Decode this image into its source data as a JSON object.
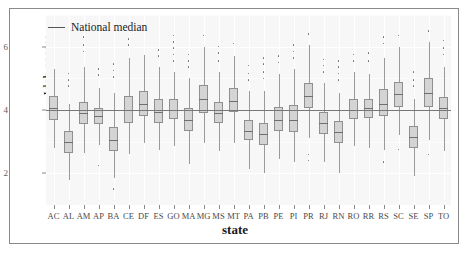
{
  "chart_data": {
    "type": "box",
    "title": "",
    "xlabel": "state",
    "ylabel": "Ideb scores",
    "ylim": [
      1.0,
      7.0
    ],
    "yticks": [
      2,
      4,
      6
    ],
    "ytick_labels": [
      "2",
      "4",
      "6"
    ],
    "grid": true,
    "legend": {
      "position": "top-left",
      "entries": [
        {
          "label": "National median",
          "marker": "line",
          "color": "#555555"
        }
      ]
    },
    "reference_lines": [
      {
        "name": "National median",
        "value": 4.0,
        "color": "#777777"
      }
    ],
    "categories": [
      "AC",
      "AL",
      "AM",
      "AP",
      "BA",
      "CE",
      "DF",
      "ES",
      "GO",
      "MA",
      "MG",
      "MS",
      "MT",
      "PA",
      "PB",
      "PE",
      "PI",
      "PR",
      "RJ",
      "RN",
      "RO",
      "RR",
      "RS",
      "SC",
      "SE",
      "SP",
      "TO"
    ],
    "boxes": [
      {
        "state": "AC",
        "lower_whisker": 2.8,
        "q1": 3.7,
        "median": 4.05,
        "q3": 4.45,
        "upper_whisker": 5.3,
        "outliers": []
      },
      {
        "state": "AL",
        "lower_whisker": 1.8,
        "q1": 2.65,
        "median": 3.0,
        "q3": 3.35,
        "upper_whisker": 4.2,
        "outliers": [
          4.75,
          4.95,
          5.15
        ]
      },
      {
        "state": "AM",
        "lower_whisker": 2.65,
        "q1": 3.55,
        "median": 3.9,
        "q3": 4.25,
        "upper_whisker": 5.35,
        "outliers": [
          5.85,
          6.05,
          6.3
        ]
      },
      {
        "state": "AP",
        "lower_whisker": 2.9,
        "q1": 3.55,
        "median": 3.8,
        "q3": 4.05,
        "upper_whisker": 4.7,
        "outliers": [
          2.25,
          5.1,
          5.3
        ]
      },
      {
        "state": "BA",
        "lower_whisker": 1.85,
        "q1": 2.7,
        "median": 3.05,
        "q3": 3.45,
        "upper_whisker": 4.55,
        "outliers": [
          1.5,
          5.05,
          5.25,
          5.45
        ]
      },
      {
        "state": "CE",
        "lower_whisker": 2.6,
        "q1": 3.6,
        "median": 4.0,
        "q3": 4.45,
        "upper_whisker": 5.65,
        "outliers": [
          6.05,
          6.25
        ]
      },
      {
        "state": "DF",
        "lower_whisker": 2.95,
        "q1": 3.8,
        "median": 4.2,
        "q3": 4.6,
        "upper_whisker": 5.75,
        "outliers": []
      },
      {
        "state": "ES",
        "lower_whisker": 2.75,
        "q1": 3.6,
        "median": 3.95,
        "q3": 4.35,
        "upper_whisker": 5.35,
        "outliers": [
          5.7,
          5.9
        ]
      },
      {
        "state": "GO",
        "lower_whisker": 2.85,
        "q1": 3.7,
        "median": 4.0,
        "q3": 4.35,
        "upper_whisker": 5.2,
        "outliers": [
          5.55,
          5.75,
          5.95,
          6.15,
          6.35
        ]
      },
      {
        "state": "MA",
        "lower_whisker": 2.3,
        "q1": 3.35,
        "median": 3.7,
        "q3": 4.05,
        "upper_whisker": 5.0,
        "outliers": [
          5.35,
          5.55,
          5.75
        ]
      },
      {
        "state": "MG",
        "lower_whisker": 2.95,
        "q1": 3.9,
        "median": 4.35,
        "q3": 4.8,
        "upper_whisker": 6.0,
        "outliers": [
          6.35
        ]
      },
      {
        "state": "MS",
        "lower_whisker": 2.7,
        "q1": 3.6,
        "median": 3.9,
        "q3": 4.25,
        "upper_whisker": 5.2,
        "outliers": [
          5.55,
          5.8,
          6.0
        ]
      },
      {
        "state": "MT",
        "lower_whisker": 2.95,
        "q1": 3.95,
        "median": 4.3,
        "q3": 4.7,
        "upper_whisker": 5.7,
        "outliers": [
          6.1
        ]
      },
      {
        "state": "PA",
        "lower_whisker": 2.15,
        "q1": 3.05,
        "median": 3.35,
        "q3": 3.7,
        "upper_whisker": 4.6,
        "outliers": [
          4.95,
          5.15,
          5.4
        ]
      },
      {
        "state": "PB",
        "lower_whisker": 2.0,
        "q1": 2.9,
        "median": 3.25,
        "q3": 3.6,
        "upper_whisker": 4.6,
        "outliers": [
          5.0,
          5.2,
          5.45,
          5.65
        ]
      },
      {
        "state": "PE",
        "lower_whisker": 2.45,
        "q1": 3.35,
        "median": 3.7,
        "q3": 4.1,
        "upper_whisker": 5.15,
        "outliers": [
          5.5,
          5.7
        ]
      },
      {
        "state": "PI",
        "lower_whisker": 2.35,
        "q1": 3.3,
        "median": 3.7,
        "q3": 4.15,
        "upper_whisker": 5.3,
        "outliers": [
          5.65,
          5.85,
          6.05
        ]
      },
      {
        "state": "PR",
        "lower_whisker": 3.1,
        "q1": 4.05,
        "median": 4.45,
        "q3": 4.85,
        "upper_whisker": 6.05,
        "outliers": [
          2.6,
          2.4,
          6.4
        ]
      },
      {
        "state": "RJ",
        "lower_whisker": 2.35,
        "q1": 3.25,
        "median": 3.6,
        "q3": 3.95,
        "upper_whisker": 4.85,
        "outliers": [
          5.2,
          5.4,
          5.6
        ]
      },
      {
        "state": "RN",
        "lower_whisker": 2.0,
        "q1": 2.95,
        "median": 3.3,
        "q3": 3.65,
        "upper_whisker": 4.55,
        "outliers": [
          4.95,
          5.15,
          5.35,
          5.55
        ]
      },
      {
        "state": "RO",
        "lower_whisker": 2.85,
        "q1": 3.7,
        "median": 4.0,
        "q3": 4.35,
        "upper_whisker": 5.2,
        "outliers": [
          5.55,
          5.75
        ]
      },
      {
        "state": "RR",
        "lower_whisker": 2.8,
        "q1": 3.75,
        "median": 4.05,
        "q3": 4.35,
        "upper_whisker": 5.15,
        "outliers": [
          5.55,
          5.8
        ]
      },
      {
        "state": "RS",
        "lower_whisker": 2.75,
        "q1": 3.8,
        "median": 4.2,
        "q3": 4.65,
        "upper_whisker": 5.65,
        "outliers": [
          2.35,
          6.1,
          6.3
        ]
      },
      {
        "state": "SC",
        "lower_whisker": 3.2,
        "q1": 4.1,
        "median": 4.5,
        "q3": 4.9,
        "upper_whisker": 6.0,
        "outliers": [
          2.75,
          6.35
        ]
      },
      {
        "state": "SE",
        "lower_whisker": 1.9,
        "q1": 2.8,
        "median": 3.15,
        "q3": 3.5,
        "upper_whisker": 4.35,
        "outliers": [
          4.75,
          4.95,
          5.2
        ]
      },
      {
        "state": "SP",
        "lower_whisker": 3.05,
        "q1": 4.1,
        "median": 4.55,
        "q3": 5.0,
        "upper_whisker": 6.15,
        "outliers": [
          2.6,
          6.5
        ]
      },
      {
        "state": "TO",
        "lower_whisker": 2.7,
        "q1": 3.7,
        "median": 4.05,
        "q3": 4.4,
        "upper_whisker": 5.35,
        "outliers": [
          5.75,
          5.95,
          6.2
        ]
      }
    ]
  }
}
